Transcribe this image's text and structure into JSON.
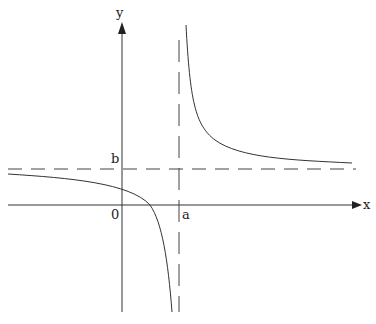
{
  "diagram": {
    "type": "hyperbola-graph",
    "labels": {
      "x_axis": "x",
      "y_axis": "y",
      "origin": "0",
      "vertical_asymptote": "a",
      "horizontal_asymptote": "b"
    },
    "colors": {
      "stroke": "#333333",
      "background": "#ffffff"
    }
  }
}
